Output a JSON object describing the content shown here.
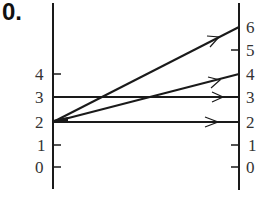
{
  "problem_label": "0.",
  "diagram": {
    "type": "mapping-diagram",
    "left_axis": {
      "ticks": [
        "0",
        "1",
        "2",
        "3",
        "4"
      ]
    },
    "right_axis": {
      "ticks": [
        "0",
        "1",
        "2",
        "3",
        "4",
        "5",
        "6"
      ]
    },
    "arrows": [
      {
        "from": 2,
        "to": 6
      },
      {
        "from": 2,
        "to": 4
      },
      {
        "from": 2,
        "to": 2
      },
      {
        "from": 3,
        "to": 3
      }
    ],
    "colors": {
      "line": "#1a1a1a",
      "text": "#333333"
    }
  }
}
